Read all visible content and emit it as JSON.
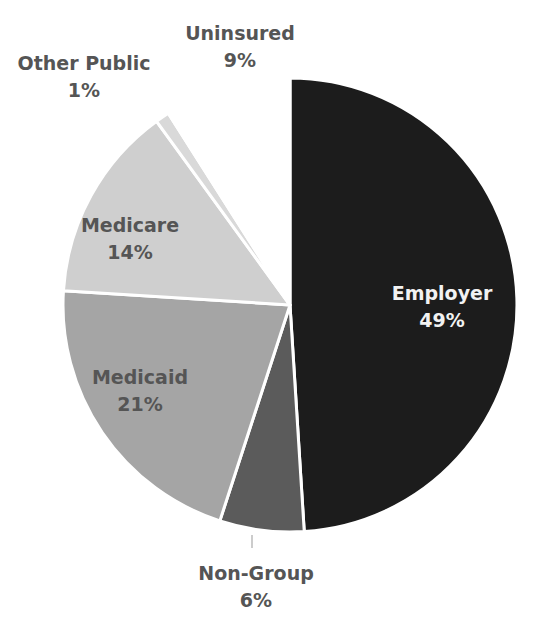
{
  "chart_data": {
    "type": "pie",
    "title": "",
    "start_angle_deg": 0,
    "direction": "clockwise",
    "categories": [
      "Employer",
      "Non-Group",
      "Medicaid",
      "Medicare",
      "Other Public",
      "Uninsured"
    ],
    "values": [
      49,
      6,
      21,
      14,
      1,
      9
    ],
    "unit": "%",
    "colors": [
      "#1c1c1c",
      "#5b5b5b",
      "#a5a5a5",
      "#cfcfcf",
      "#d9d9d9",
      "#ffffff"
    ],
    "labels": [
      {
        "name": "Employer",
        "value": "49%",
        "position": "inside",
        "color": "#f2f2f2"
      },
      {
        "name": "Non-Group",
        "value": "6%",
        "position": "outside",
        "color": "#555555"
      },
      {
        "name": "Medicaid",
        "value": "21%",
        "position": "inside",
        "color": "#555555"
      },
      {
        "name": "Medicare",
        "value": "14%",
        "position": "inside",
        "color": "#555555"
      },
      {
        "name": "Other Public",
        "value": "1%",
        "position": "outside",
        "color": "#555555"
      },
      {
        "name": "Uninsured",
        "value": "9%",
        "position": "outside",
        "color": "#555555"
      }
    ],
    "legend": "none"
  },
  "layout": {
    "center": [
      290,
      305
    ],
    "radius": 227,
    "label_positions": [
      [
        442,
        280
      ],
      [
        256,
        560
      ],
      [
        140,
        364
      ],
      [
        130,
        212
      ],
      [
        84,
        50
      ],
      [
        240,
        20
      ]
    ],
    "leader_line": {
      "from": [
        252,
        535
      ],
      "to": [
        252,
        548
      ]
    }
  }
}
